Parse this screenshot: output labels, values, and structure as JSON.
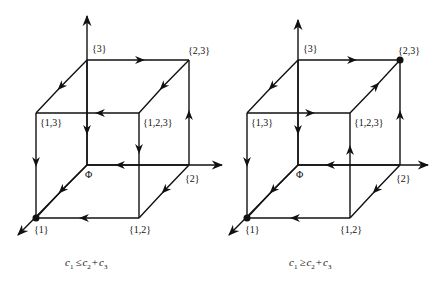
{
  "colors": {
    "ink": "#111111",
    "background": "#ffffff"
  },
  "diagrams": [
    {
      "caption": {
        "c1": "c",
        "s1": "1",
        "rel": "≤",
        "c2": "c",
        "s2": "2",
        "plus": "+",
        "c3": "c",
        "s3": "3"
      },
      "labels": {
        "v3": "{3}",
        "v23": "{2,3}",
        "v13": "{1,3}",
        "v123": "{1,2,3}",
        "phi": "Φ",
        "v2": "{2}",
        "v1": "{1}",
        "v12": "{1,2}"
      },
      "marked_vertex": "{1}"
    },
    {
      "caption": {
        "c1": "c",
        "s1": "1",
        "rel": "≥",
        "c2": "c",
        "s2": "2",
        "plus": "+",
        "c3": "c",
        "s3": "3"
      },
      "labels": {
        "v3": "{3}",
        "v23": "{2,3}",
        "v13": "{1,3}",
        "v123": "{1,2,3}",
        "phi": "Φ",
        "v2": "{2}",
        "v1": "{1}",
        "v12": "{1,2}"
      },
      "marked_vertex": "{1}, {2,3}"
    }
  ]
}
